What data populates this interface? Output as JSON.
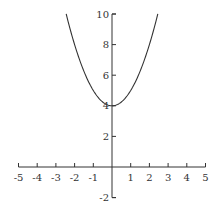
{
  "chart_data": {
    "type": "line",
    "title": "",
    "xlabel": "",
    "ylabel": "",
    "function": "y = x^2 + 4",
    "xlim": [
      -5,
      5
    ],
    "ylim": [
      -2,
      10
    ],
    "grid": false,
    "x_ticks": [
      -5,
      -4,
      -3,
      -2,
      -1,
      1,
      2,
      3,
      4,
      5
    ],
    "x_tick_labels": [
      "-5",
      "-4",
      "-3",
      "-2",
      "-1",
      "1",
      "2",
      "3",
      "4",
      "5"
    ],
    "y_ticks": [
      -2,
      2,
      4,
      6,
      8,
      10
    ],
    "y_tick_labels": [
      "-2",
      "2",
      "4",
      "6",
      "8",
      "10"
    ],
    "series": [
      {
        "name": "parabola",
        "x": [
          -2.45,
          -2,
          -1.5,
          -1,
          -0.5,
          0,
          0.5,
          1,
          1.5,
          2,
          2.45
        ],
        "y": [
          10.0,
          8,
          6.25,
          5,
          4.25,
          4,
          4.25,
          5,
          6.25,
          8,
          10.0
        ]
      }
    ],
    "colors": {
      "curve": "#333333",
      "axes": "#333333"
    }
  }
}
